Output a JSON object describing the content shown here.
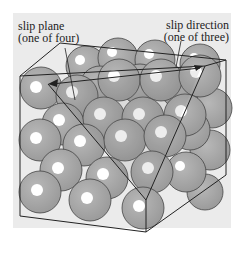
{
  "figure": {
    "labels": {
      "slip_plane": {
        "line1": "slip plane",
        "line2": "(one of four)"
      },
      "slip_direction": {
        "line1": "slip direction",
        "line2": "(one of three)"
      }
    },
    "colors": {
      "panel_background": "#ebebeb",
      "atom_fill": "#a6a6a6",
      "atom_highlight": "#ffffff",
      "outline": "#333333",
      "slip_plane_shade": "#8c8c8c"
    }
  }
}
